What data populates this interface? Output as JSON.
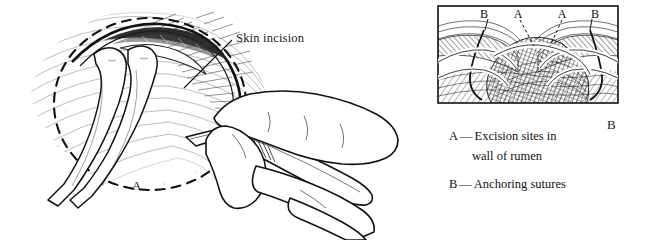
{
  "figure": {
    "kind": "medical-illustration",
    "background": "#ffffff",
    "ink": "#111111",
    "panels": [
      {
        "id": "A",
        "letter": "A",
        "callout": "Skin incision",
        "subject": "hand holding scalpel making a skin incision over the left paralumbar fossa, tissue held with forceps, dashed circle marking the planned fistula site"
      },
      {
        "id": "B",
        "letter": "B",
        "subject": "boxed cross-hatched view of exposed rumen wall with anchoring sutures and excision sites",
        "inset_labels": [
          "B",
          "A",
          "A",
          "B"
        ]
      }
    ]
  },
  "callout": {
    "skin_incision": "Skin incision"
  },
  "panel_letters": {
    "left": "A",
    "right": "B"
  },
  "inset": {
    "label_b_left": "B",
    "label_a_left": "A",
    "label_a_right": "A",
    "label_b_right": "B"
  },
  "legend": {
    "items": [
      {
        "key": "A",
        "dash": "—",
        "line1": "Excision sites in",
        "line2": "wall of rumen"
      },
      {
        "key": "B",
        "dash": "—",
        "line1": "Anchoring sutures",
        "line2": ""
      }
    ]
  },
  "colors": {
    "ink": "#111111",
    "paper": "#ffffff",
    "hatch": "#2b2b2b",
    "light_hatch": "#6a6a6a"
  }
}
